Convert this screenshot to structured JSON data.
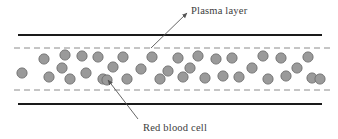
{
  "figure": {
    "title_present": false,
    "background_color": "#ffffff"
  },
  "labels": {
    "plasma": "Plasma layer",
    "red_blood_cell": "Red blood cell"
  },
  "colors": {
    "vessel_wall": "#1a1a1a",
    "plasma_boundary": "#8c8c8c",
    "cell_fill": "#9a9a9a",
    "cell_stroke": "#6e6e6e",
    "leader_line": "#555555",
    "text": "#3c3c3c"
  },
  "vessel": {
    "wall_top_y": 35,
    "wall_bottom_y": 104,
    "wall_x_start": 18,
    "wall_x_end": 322,
    "wall_thickness": 2.2,
    "plasma_top_y": 48,
    "plasma_bottom_y": 90,
    "plasma_x_start": 14,
    "plasma_x_end": 330,
    "dash_pattern": "6 4"
  },
  "leaders": [
    {
      "name": "plasma-leader",
      "x1": 151,
      "y1": 48,
      "x2": 187,
      "y2": 13,
      "arrow_at": "end"
    },
    {
      "name": "rbc-leader",
      "x1": 138,
      "y1": 119,
      "x2": 108,
      "y2": 80,
      "arrow_at": "end"
    }
  ],
  "chart_data": {
    "type": "scatter",
    "xlabel": "",
    "ylabel": "",
    "xlim": [
      0,
      338
    ],
    "ylim": [
      0,
      139
    ],
    "grid": false,
    "legend": "none",
    "annotations": [
      "Plasma layer",
      "Red blood cell"
    ],
    "series": [
      {
        "name": "Red blood cells",
        "marker": "circle",
        "radius": 5.1,
        "fill": "#9a9a9a",
        "stroke": "#6e6e6e",
        "points": [
          [
            22,
            73
          ],
          [
            44,
            59
          ],
          [
            49,
            77
          ],
          [
            62,
            68
          ],
          [
            65,
            55
          ],
          [
            70,
            79
          ],
          [
            82,
            56
          ],
          [
            86,
            73
          ],
          [
            98,
            57
          ],
          [
            103,
            79
          ],
          [
            107,
            80
          ],
          [
            113,
            67
          ],
          [
            123,
            57
          ],
          [
            127,
            79
          ],
          [
            141,
            69
          ],
          [
            152,
            57
          ],
          [
            160,
            79
          ],
          [
            168,
            71
          ],
          [
            178,
            58
          ],
          [
            183,
            77
          ],
          [
            190,
            68
          ],
          [
            198,
            56
          ],
          [
            205,
            78
          ],
          [
            216,
            59
          ],
          [
            223,
            76
          ],
          [
            232,
            58
          ],
          [
            239,
            77
          ],
          [
            252,
            68
          ],
          [
            263,
            56
          ],
          [
            268,
            79
          ],
          [
            281,
            58
          ],
          [
            286,
            76
          ],
          [
            297,
            68
          ],
          [
            308,
            57
          ],
          [
            312,
            78
          ],
          [
            320,
            79
          ]
        ]
      }
    ]
  }
}
